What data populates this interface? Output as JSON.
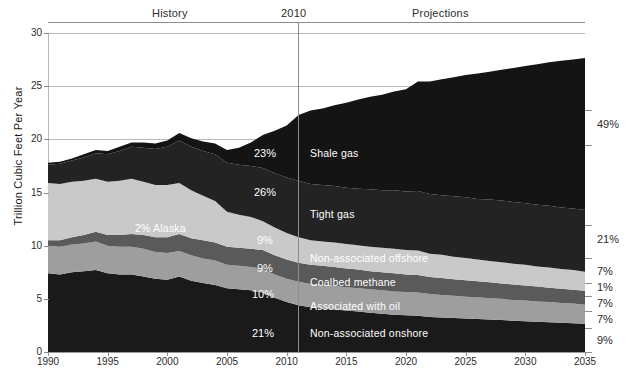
{
  "header": {
    "history_label": "History",
    "year_marker": "2010",
    "projections_label": "Projections"
  },
  "axes": {
    "y_title": "Trillion Cubic Feet Per Year",
    "y_ticks": [
      "0",
      "5",
      "10",
      "15",
      "20",
      "25",
      "30"
    ],
    "x_ticks": [
      "1990",
      "1995",
      "2000",
      "2005",
      "2010",
      "2015",
      "2020",
      "2025",
      "2030",
      "2035"
    ]
  },
  "series_labels": {
    "shale_gas": "Shale gas",
    "tight_gas": "Tight gas",
    "non_assoc_offshore": "Non-associated offshore",
    "coalbed_methane": "Coalbed methane",
    "associated_with_oil": "Associated with oil",
    "non_assoc_onshore": "Non-associated onshore",
    "alaska": "2% Alaska"
  },
  "inline_percents": {
    "shale_gas": "23%",
    "tight_gas": "26%",
    "non_assoc_offshore": "9%",
    "coalbed_methane": "9%",
    "associated_with_oil": "10%",
    "non_assoc_onshore": "21%"
  },
  "right_percents": [
    {
      "value": "49%",
      "y": 125
    },
    {
      "value": "21%",
      "y": 240
    },
    {
      "value": "7%",
      "y": 272
    },
    {
      "value": "1%",
      "y": 288
    },
    {
      "value": "7%",
      "y": 304
    },
    {
      "value": "7%",
      "y": 320
    },
    {
      "value": "9%",
      "y": 341
    }
  ],
  "colors": {
    "shale_gas": "#141414",
    "tight_gas": "#232323",
    "non_assoc_offshore": "#c9c9c9",
    "coalbed_methane": "#5a5a5a",
    "associated_with_oil": "#9e9e9e",
    "non_assoc_onshore": "#1a1a1a",
    "grid": "#b9b9b9",
    "text": "#2b2b2b"
  },
  "chart_data": {
    "type": "area",
    "title": "",
    "subtitle": "",
    "xlabel": "",
    "ylabel": "Trillion Cubic Feet Per Year",
    "xlim": [
      1990,
      2035
    ],
    "ylim": [
      0,
      30
    ],
    "grid": true,
    "stacked": true,
    "legend": "inline-annotations",
    "history_projection_split": 2010,
    "x": [
      1990,
      1991,
      1992,
      1993,
      1994,
      1995,
      1996,
      1997,
      1998,
      1999,
      2000,
      2001,
      2002,
      2003,
      2004,
      2005,
      2006,
      2007,
      2008,
      2009,
      2010,
      2011,
      2012,
      2013,
      2014,
      2015,
      2016,
      2017,
      2018,
      2019,
      2020,
      2021,
      2022,
      2023,
      2024,
      2025,
      2026,
      2027,
      2028,
      2029,
      2030,
      2031,
      2032,
      2033,
      2034,
      2035
    ],
    "series": [
      {
        "name": "Non-associated onshore",
        "share_2035": "9%",
        "share_2009": "21%",
        "values": [
          7.4,
          7.3,
          7.5,
          7.6,
          7.7,
          7.4,
          7.3,
          7.3,
          7.1,
          6.9,
          6.8,
          7.1,
          6.7,
          6.5,
          6.3,
          6.0,
          5.9,
          5.8,
          5.6,
          5.1,
          4.7,
          4.4,
          4.2,
          4.1,
          4.0,
          3.9,
          3.8,
          3.7,
          3.6,
          3.5,
          3.45,
          3.4,
          3.3,
          3.25,
          3.2,
          3.15,
          3.1,
          3.05,
          3.0,
          2.95,
          2.9,
          2.85,
          2.8,
          2.75,
          2.7,
          2.65
        ]
      },
      {
        "name": "Associated with oil",
        "share_2035": "7%",
        "share_2009": "10%",
        "values": [
          2.6,
          2.6,
          2.6,
          2.6,
          2.7,
          2.6,
          2.6,
          2.6,
          2.6,
          2.5,
          2.5,
          2.4,
          2.4,
          2.3,
          2.3,
          2.2,
          2.2,
          2.2,
          2.2,
          2.2,
          2.2,
          2.2,
          2.2,
          2.2,
          2.2,
          2.2,
          2.2,
          2.2,
          2.2,
          2.2,
          2.2,
          2.2,
          2.15,
          2.1,
          2.1,
          2.05,
          2.05,
          2.0,
          2.0,
          1.95,
          1.95,
          1.9,
          1.9,
          1.85,
          1.85,
          1.8
        ]
      },
      {
        "name": "Coalbed methane",
        "share_2035": "1%",
        "share_2009": "9%",
        "values": [
          0.5,
          0.6,
          0.7,
          0.8,
          0.9,
          1.0,
          1.1,
          1.2,
          1.3,
          1.4,
          1.5,
          1.6,
          1.6,
          1.7,
          1.7,
          1.7,
          1.7,
          1.7,
          1.8,
          1.8,
          1.8,
          1.8,
          1.8,
          1.8,
          1.8,
          1.75,
          1.75,
          1.7,
          1.7,
          1.7,
          1.65,
          1.65,
          1.6,
          1.6,
          1.55,
          1.55,
          1.5,
          1.5,
          1.45,
          1.45,
          1.4,
          1.4,
          1.35,
          1.35,
          1.3,
          1.3
        ]
      },
      {
        "name": "Non-associated offshore",
        "share_2035": "7%",
        "share_2009": "9%",
        "values": [
          5.4,
          5.3,
          5.2,
          5.1,
          5.0,
          5.0,
          5.1,
          5.2,
          5.0,
          4.9,
          4.9,
          4.8,
          4.5,
          4.2,
          3.9,
          3.3,
          3.1,
          3.0,
          2.7,
          2.6,
          2.5,
          2.4,
          2.3,
          2.3,
          2.3,
          2.3,
          2.3,
          2.3,
          2.3,
          2.3,
          2.3,
          2.3,
          2.2,
          2.2,
          2.1,
          2.1,
          2.05,
          2.0,
          2.0,
          1.95,
          1.95,
          1.9,
          1.9,
          1.85,
          1.85,
          1.8
        ]
      },
      {
        "name": "Tight gas",
        "share_2035": "21%",
        "share_2009": "26%",
        "values": [
          1.7,
          1.9,
          2.0,
          2.2,
          2.4,
          2.6,
          2.8,
          3.0,
          3.2,
          3.4,
          3.6,
          4.0,
          4.1,
          4.2,
          4.4,
          4.6,
          4.7,
          4.8,
          5.0,
          5.1,
          5.2,
          5.3,
          5.3,
          5.3,
          5.3,
          5.3,
          5.3,
          5.4,
          5.4,
          5.5,
          5.5,
          5.6,
          5.6,
          5.6,
          5.7,
          5.7,
          5.7,
          5.8,
          5.8,
          5.8,
          5.8,
          5.8,
          5.8,
          5.8,
          5.8,
          5.8
        ]
      },
      {
        "name": "Shale gas",
        "share_2035": "49%",
        "share_2009": "23%",
        "values": [
          0.2,
          0.2,
          0.2,
          0.3,
          0.3,
          0.3,
          0.4,
          0.4,
          0.5,
          0.5,
          0.6,
          0.7,
          0.8,
          0.9,
          1.0,
          1.2,
          1.6,
          2.2,
          3.1,
          4.0,
          4.9,
          6.2,
          6.9,
          7.2,
          7.6,
          8.0,
          8.4,
          8.7,
          9.0,
          9.3,
          9.6,
          10.3,
          10.6,
          10.9,
          11.2,
          11.5,
          11.8,
          12.0,
          12.3,
          12.6,
          12.9,
          13.2,
          13.5,
          13.8,
          14.0,
          14.3
        ]
      }
    ]
  }
}
